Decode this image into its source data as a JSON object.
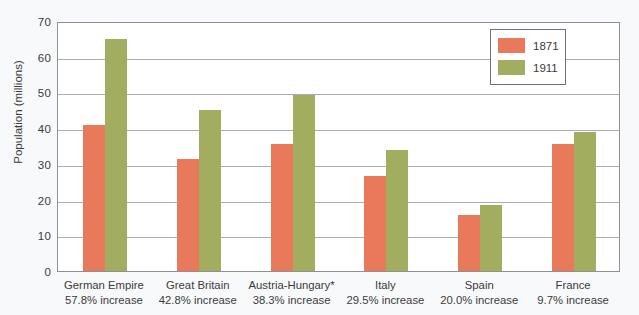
{
  "chart_data": {
    "type": "bar",
    "title": "",
    "subtitle": "",
    "xlabel": "",
    "ylabel": "Population (millions)",
    "ylim": [
      0,
      70
    ],
    "ytick_step": 10,
    "yticks": [
      70,
      60,
      50,
      40,
      30,
      20,
      10,
      0
    ],
    "grid": true,
    "legend_position": "top-right",
    "categories": [
      "German Empire",
      "Great Britain",
      "Austria-Hungary*",
      "Italy",
      "Spain",
      "France"
    ],
    "category_sublabels": [
      "57.8% increase",
      "42.8% increase",
      "38.3% increase",
      "29.5% increase",
      "20.0% increase",
      "9.7% increase"
    ],
    "series": [
      {
        "name": "1871",
        "color": "#e8795a",
        "values": [
          41.0,
          31.5,
          35.5,
          26.5,
          15.7,
          35.5
        ]
      },
      {
        "name": "1911",
        "color": "#a3ad60",
        "values": [
          65.0,
          45.2,
          49.2,
          34.0,
          18.5,
          39.0
        ]
      }
    ]
  },
  "legend": {
    "entries": [
      {
        "label": "1871",
        "color": "#e8795a"
      },
      {
        "label": "1911",
        "color": "#a3ad60"
      }
    ]
  },
  "colors": {
    "series_1871": "#e8795a",
    "series_1911": "#a3ad60",
    "gridline": "#a9acb1",
    "axis": "#8d9095",
    "text": "#3b3b3c",
    "plot_background": "#ffffff",
    "page_background": "#f8f9fb"
  }
}
